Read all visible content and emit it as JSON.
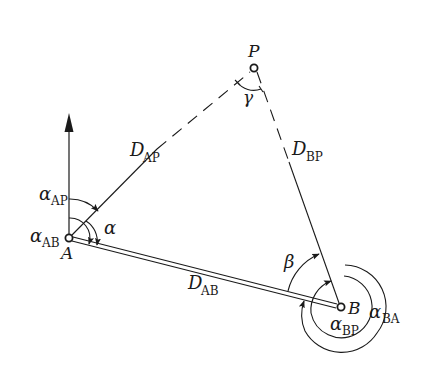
{
  "diagram": {
    "type": "surveying-intersection-geometry",
    "colors": {
      "ink": "#1a1a1a",
      "background": "#ffffff"
    },
    "points": {
      "A": {
        "label": "A",
        "x": 69,
        "y": 238
      },
      "B": {
        "label": "B",
        "x": 341,
        "y": 307
      },
      "P": {
        "label": "P",
        "x": 254,
        "y": 68
      }
    },
    "distances": {
      "AP": {
        "main": "D",
        "sub": "AP"
      },
      "BP": {
        "main": "D",
        "sub": "BP"
      },
      "AB": {
        "main": "D",
        "sub": "AB"
      }
    },
    "angles": {
      "alpha_AP": {
        "main": "α",
        "sub": "AP"
      },
      "alpha_AB": {
        "main": "α",
        "sub": "AB"
      },
      "alpha": {
        "main": "α"
      },
      "beta": {
        "main": "β"
      },
      "gamma": {
        "main": "γ"
      },
      "alpha_BP": {
        "main": "α",
        "sub": "BP"
      },
      "alpha_BA": {
        "main": "α",
        "sub": "BA"
      }
    },
    "north_arrow": {
      "label": "north-direction"
    }
  }
}
